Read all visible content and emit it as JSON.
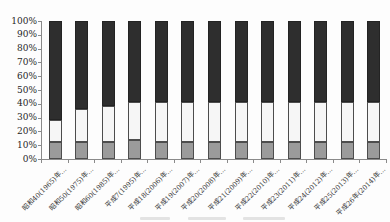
{
  "chart_data": {
    "type": "bar",
    "stacked": true,
    "stack_total": 100,
    "title": "",
    "xlabel": "",
    "ylabel": "",
    "ylim": [
      0,
      100
    ],
    "grid": false,
    "legend_position": "bottom (cut off at image edge, unreadable)",
    "y_ticks": [
      "0%",
      "10%",
      "20%",
      "30%",
      "40%",
      "50%",
      "60%",
      "70%",
      "80%",
      "90%",
      "100%"
    ],
    "categories": [
      "昭和40(1965)年…",
      "昭和50(1975)年…",
      "昭和60(1985)年…",
      "平成7(1995)年…",
      "平成18(2006)年…",
      "平成19(2007)年…",
      "平成20(2008)年…",
      "平成21(2009)年…",
      "平成22(2010)年…",
      "平成23(2011)年…",
      "平成24(2012)年…",
      "平成25(2013)年…",
      "平成26年(2014)年…"
    ],
    "series": [
      {
        "name": "bottom segment (gray)",
        "color": "#9b9b9b",
        "values": [
          12.5,
          12.5,
          12.5,
          13.5,
          12.5,
          12.5,
          12.5,
          12.5,
          12.5,
          12.5,
          12.5,
          12.5,
          12.5
        ]
      },
      {
        "name": "middle segment (white)",
        "color": "#f6f6f6",
        "values": [
          16,
          23.5,
          26,
          27.5,
          29,
          28.5,
          29,
          28.5,
          28.5,
          28.5,
          28.5,
          28.5,
          29
        ]
      },
      {
        "name": "top segment (dark)",
        "color": "#2e2e2e",
        "values": [
          71.5,
          64,
          61.5,
          59,
          58.5,
          59,
          58.5,
          59,
          59,
          59,
          59,
          59,
          58.5
        ]
      }
    ]
  },
  "style": {
    "axis_color": "#8a8a8a",
    "text_color": "#262626",
    "background": "#fdfdfd"
  },
  "legend_cutoff_fragments": [
    {
      "x": 140,
      "w": 30
    },
    {
      "x": 188,
      "w": 38
    },
    {
      "x": 243,
      "w": 42
    }
  ]
}
